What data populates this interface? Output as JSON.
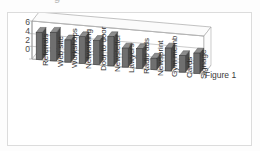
{
  "figure": {
    "clipped_title": "g",
    "annotation": "Figure 1"
  },
  "chart_data": {
    "type": "bar",
    "title": "",
    "subtitle": "",
    "xlabel": "",
    "ylabel": "",
    "ylim": [
      0,
      6
    ],
    "yticks": [
      "0",
      "2",
      "4",
      "6"
    ],
    "grid": true,
    "legend": false,
    "legend_position": "none",
    "style": "3d-perspective-column",
    "annotation": "Figure 1",
    "categories": [
      "Referrals",
      "Web site",
      "Workshops",
      "Networking",
      "Door to door",
      "Newsletter",
      "Lawyers",
      "Radio ads",
      "Newsprint",
      "Gym memb",
      "Cards",
      "Signage"
    ],
    "values": [
      4.3,
      4.5,
      3.5,
      4.2,
      3.8,
      4.6,
      3.0,
      3.1,
      1.8,
      3.6,
      2.6,
      3.2
    ],
    "series": [
      {
        "name": "Series 1",
        "values": [
          4.3,
          4.5,
          3.5,
          4.2,
          3.8,
          4.6,
          3.0,
          3.1,
          1.8,
          3.6,
          2.6,
          3.2
        ],
        "color": "#6f6f6f"
      }
    ],
    "colors": {
      "bar": "#6f6f6f",
      "bar_side": "#4a4a4a",
      "axis": "#9a9a9a",
      "grid": "#b5b5b5",
      "text": "#2e2e2e",
      "background": "#ffffff"
    }
  }
}
